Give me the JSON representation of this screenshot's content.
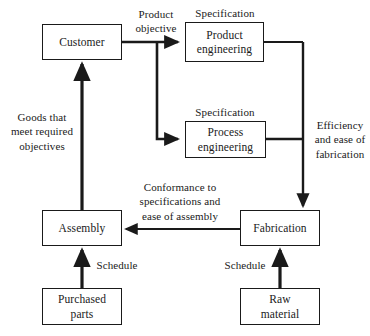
{
  "diagram": {
    "colors": {
      "ink": "#1a1a1a",
      "background": "#ffffff"
    },
    "nodes": [
      {
        "id": "customer",
        "label": "Customer",
        "x": 42,
        "y": 24,
        "w": 80,
        "h": 36
      },
      {
        "id": "product-engineering",
        "label": "Product\nengineering",
        "x": 185,
        "y": 22,
        "w": 79,
        "h": 40
      },
      {
        "id": "process-engineering",
        "label": "Process\nengineering",
        "x": 185,
        "y": 121,
        "w": 81,
        "h": 37
      },
      {
        "id": "assembly",
        "label": "Assembly",
        "x": 42,
        "y": 210,
        "w": 80,
        "h": 36
      },
      {
        "id": "fabrication",
        "label": "Fabrication",
        "x": 240,
        "y": 210,
        "w": 80,
        "h": 36
      },
      {
        "id": "purchased-parts",
        "label": "Purchased\nparts",
        "x": 42,
        "y": 288,
        "w": 80,
        "h": 37
      },
      {
        "id": "raw-material",
        "label": "Raw\nmaterial",
        "x": 240,
        "y": 288,
        "w": 80,
        "h": 37
      }
    ],
    "edge_labels": [
      {
        "id": "product-objective",
        "text": "Product\nobjective",
        "x": 124,
        "y": 7,
        "w": 64
      },
      {
        "id": "specification-top",
        "text": "Specification",
        "x": 185,
        "y": 6,
        "w": 80
      },
      {
        "id": "specification-mid",
        "text": "Specification",
        "x": 185,
        "y": 105,
        "w": 80
      },
      {
        "id": "goods-returned",
        "text": "Goods that\nmeet required\nobjectives",
        "x": 6,
        "y": 110,
        "w": 72
      },
      {
        "id": "efficiency-ease",
        "text": "Efficiency\nand ease of\nfabrication",
        "x": 311,
        "y": 118,
        "w": 58
      },
      {
        "id": "conformance",
        "text": "Conformance to\nspecifications and\nease of assembly",
        "x": 128,
        "y": 180,
        "w": 104
      },
      {
        "id": "schedule-left",
        "text": "Schedule",
        "x": 89,
        "y": 258,
        "w": 56
      },
      {
        "id": "schedule-right",
        "text": "Schedule",
        "x": 217,
        "y": 258,
        "w": 56
      }
    ],
    "edges": [
      {
        "id": "customer-to-product-engineering",
        "from": "customer",
        "to": "product-engineering",
        "relation": "Product objective"
      },
      {
        "id": "customer-to-process-engineering",
        "from": "customer",
        "to": "process-engineering",
        "relation": "Product objective"
      },
      {
        "id": "product-engineering-to-fabrication",
        "from": "product-engineering",
        "to": "fabrication",
        "relation": "Specification / Efficiency and ease of fabrication"
      },
      {
        "id": "process-engineering-to-fabrication",
        "from": "process-engineering",
        "to": "fabrication",
        "relation": "Specification / Efficiency and ease of fabrication"
      },
      {
        "id": "fabrication-to-assembly",
        "from": "fabrication",
        "to": "assembly",
        "relation": "Conformance to specifications and ease of assembly"
      },
      {
        "id": "assembly-to-customer",
        "from": "assembly",
        "to": "customer",
        "relation": "Goods that meet required objectives"
      },
      {
        "id": "purchased-parts-to-assembly",
        "from": "purchased-parts",
        "to": "assembly",
        "relation": "Schedule"
      },
      {
        "id": "raw-material-to-fabrication",
        "from": "raw-material",
        "to": "fabrication",
        "relation": "Schedule"
      }
    ]
  }
}
